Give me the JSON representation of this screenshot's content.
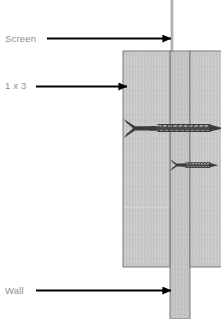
{
  "diagram": {
    "type": "technical-cross-section",
    "width": 221,
    "height": 319,
    "background_color": "#ffffff",
    "labels": [
      {
        "id": "screen",
        "text": "Screen",
        "x": 5,
        "y": 33,
        "color": "#8d8d8d"
      },
      {
        "id": "board",
        "text": "1 x 3",
        "x": 5,
        "y": 80,
        "color": "#8d8d8d"
      },
      {
        "id": "wall",
        "text": "Wall",
        "x": 5,
        "y": 285,
        "color": "#8d8d8d"
      }
    ],
    "leader_arrows": [
      {
        "id": "arrow-screen",
        "from_x": 47,
        "to_x": 172,
        "y": 38,
        "color": "#000000"
      },
      {
        "id": "arrow-board",
        "from_x": 36,
        "to_x": 128,
        "y": 86,
        "color": "#000000"
      },
      {
        "id": "arrow-wall",
        "from_x": 36,
        "to_x": 172,
        "y": 290,
        "color": "#000000"
      }
    ],
    "parts": [
      {
        "id": "screen-mesh",
        "name": "Screen",
        "shape": "thin-vertical-line",
        "x": 171,
        "y": 0,
        "width": 2.4,
        "height": 52,
        "fill": "#b6b6b6"
      },
      {
        "id": "board-front",
        "name": "1 x 3 front board",
        "shape": "rectangle",
        "x": 123,
        "y": 51,
        "width": 47,
        "height": 216,
        "fill": "#c8c8c8",
        "stroke": "#6e6e6e"
      },
      {
        "id": "wall-stud",
        "name": "Wall",
        "shape": "rectangle",
        "x": 170,
        "y": 51,
        "width": 20,
        "height": 268,
        "fill": "#c4c4c4",
        "stroke": "#6e6e6e"
      },
      {
        "id": "board-back",
        "name": "1 x 3 back board",
        "shape": "rectangle",
        "x": 190,
        "y": 51,
        "width": 31,
        "height": 216,
        "fill": "#c8c8c8",
        "stroke": "#6e6e6e"
      }
    ],
    "fasteners": [
      {
        "id": "screw-long",
        "name": "long wood screw",
        "head_x": 123,
        "tip_x": 224,
        "y": 128,
        "head_style": "countersunk-flat",
        "thread_start_x": 155,
        "thread_end_x": 214,
        "color": "#3a3a3a"
      },
      {
        "id": "screw-short",
        "name": "short wood screw",
        "head_x": 170,
        "tip_x": 218,
        "y": 165,
        "head_style": "countersunk-flat",
        "thread_start_x": 184,
        "thread_end_x": 212,
        "color": "#3a3a3a"
      }
    ],
    "colors": {
      "wood": "#c8c8c8",
      "wood_edge": "#6e6e6e",
      "screen_line": "#b6b6b6",
      "arrow": "#000000",
      "label_text": "#8d8d8d",
      "screw": "#3a3a3a"
    }
  }
}
